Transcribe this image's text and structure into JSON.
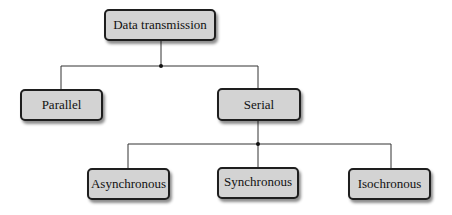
{
  "diagram": {
    "type": "tree",
    "root": {
      "label": "Data transmission",
      "children": [
        {
          "label": "Parallel",
          "children": []
        },
        {
          "label": "Serial",
          "children": [
            {
              "label": "Asynchronous"
            },
            {
              "label": "Synchronous"
            },
            {
              "label": "Isochronous"
            }
          ]
        }
      ]
    },
    "colors": {
      "node_fill": "#d3d3d3",
      "node_border": "#1e1e1e",
      "line": "#333333",
      "text": "#111111",
      "background": "#ffffff"
    }
  },
  "nodes": {
    "root": "Data transmission",
    "parallel": "Parallel",
    "serial": "Serial",
    "asynchronous": "Asynchronous",
    "synchronous": "Synchronous",
    "isochronous": "Isochronous"
  }
}
